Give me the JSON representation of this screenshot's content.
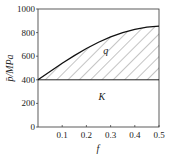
{
  "chart_data": {
    "type": "area",
    "title": "",
    "xlabel": "f",
    "ylabel": "p̄/MPa",
    "xlim": [
      0,
      0.5
    ],
    "ylim": [
      0,
      1000
    ],
    "xticks": [
      "0.1",
      "0.2",
      "0.3",
      "0.4",
      "0.5"
    ],
    "xtick_values": [
      0.1,
      0.2,
      0.3,
      0.4,
      0.5
    ],
    "yticks": [
      "0",
      "200",
      "400",
      "600",
      "800",
      "1000"
    ],
    "ytick_values": [
      0,
      200,
      400,
      600,
      800,
      1000
    ],
    "series": [
      {
        "name": "K",
        "x": [
          0,
          0.5
        ],
        "y": [
          400,
          400
        ]
      },
      {
        "name": "K + q",
        "x": [
          0,
          0.05,
          0.1,
          0.15,
          0.2,
          0.25,
          0.3,
          0.35,
          0.4,
          0.45,
          0.5
        ],
        "y": [
          400,
          470,
          540,
          605,
          665,
          718,
          763,
          800,
          828,
          846,
          855
        ]
      }
    ],
    "annotations": [
      {
        "text": "q",
        "x": 0.27,
        "y": 620
      },
      {
        "text": "K",
        "x": 0.25,
        "y": 230
      }
    ],
    "grid": false
  }
}
